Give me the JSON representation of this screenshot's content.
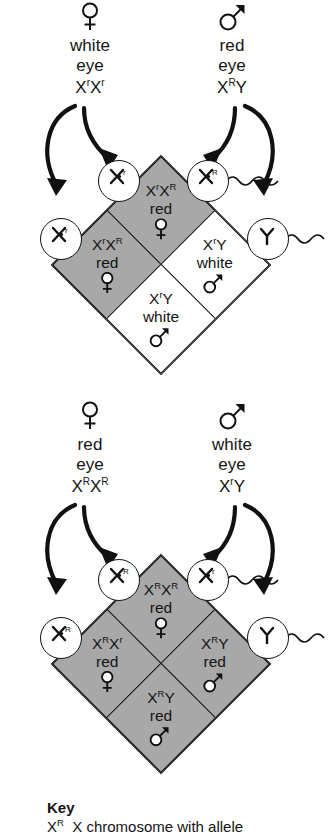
{
  "figure": {
    "type": "punnett-square-diagram",
    "topic": "X-linked eye color inheritance in fruit flies",
    "shaded_meaning": "red eye (dominant phenotype)"
  },
  "crosses": [
    {
      "id": "cross-1",
      "female_parent": {
        "sex": "female",
        "sex_symbol": "venus-symbol",
        "phenotype_line1": "white",
        "phenotype_line2": "eye",
        "genotype": "XʳXʳ",
        "genotype_base": "X",
        "allele_sup": "r"
      },
      "male_parent": {
        "sex": "male",
        "sex_symbol": "mars-symbol",
        "phenotype_line1": "red",
        "phenotype_line2": "eye",
        "genotype": "XᴿY",
        "genotype_base": "X",
        "allele_sup": "R"
      },
      "gametes": {
        "eggs": [
          {
            "label": "X",
            "sup": "r",
            "name": "egg-top-left"
          },
          {
            "label": "X",
            "sup": "r",
            "name": "egg-left"
          }
        ],
        "sperm": [
          {
            "label": "X",
            "sup": "R",
            "name": "sperm-top-right",
            "has_tail": true
          },
          {
            "label": "Y",
            "sup": "",
            "name": "sperm-right",
            "has_tail": true
          }
        ]
      },
      "cells": [
        {
          "position": "top",
          "genotype_base": "X",
          "sup1": "r",
          "mid": "X",
          "sup2": "R",
          "phenotype": "red",
          "sex": "female",
          "shaded": true
        },
        {
          "position": "right",
          "genotype_base": "X",
          "sup1": "r",
          "mid": "Y",
          "sup2": "",
          "phenotype": "white",
          "sex": "male",
          "shaded": false
        },
        {
          "position": "left",
          "genotype_base": "X",
          "sup1": "r",
          "mid": "X",
          "sup2": "R",
          "phenotype": "red",
          "sex": "female",
          "shaded": true
        },
        {
          "position": "bottom",
          "genotype_base": "X",
          "sup1": "r",
          "mid": "Y",
          "sup2": "",
          "phenotype": "white",
          "sex": "male",
          "shaded": false
        }
      ]
    },
    {
      "id": "cross-2",
      "female_parent": {
        "sex": "female",
        "sex_symbol": "venus-symbol",
        "phenotype_line1": "red",
        "phenotype_line2": "eye",
        "genotype": "XᴿXᴿ",
        "genotype_base": "X",
        "allele_sup": "R"
      },
      "male_parent": {
        "sex": "male",
        "sex_symbol": "mars-symbol",
        "phenotype_line1": "white",
        "phenotype_line2": "eye",
        "genotype": "XʳY",
        "genotype_base": "X",
        "allele_sup": "r"
      },
      "gametes": {
        "eggs": [
          {
            "label": "X",
            "sup": "R",
            "name": "egg-top-left"
          },
          {
            "label": "X",
            "sup": "R",
            "name": "egg-left"
          }
        ],
        "sperm": [
          {
            "label": "X",
            "sup": "r",
            "name": "sperm-top-right",
            "has_tail": true
          },
          {
            "label": "Y",
            "sup": "",
            "name": "sperm-right",
            "has_tail": true
          }
        ]
      },
      "cells": [
        {
          "position": "top",
          "genotype_base": "X",
          "sup1": "R",
          "mid": "X",
          "sup2": "R",
          "phenotype": "red",
          "sex": "female",
          "shaded": true
        },
        {
          "position": "right",
          "genotype_base": "X",
          "sup1": "R",
          "mid": "Y",
          "sup2": "",
          "phenotype": "red",
          "sex": "male",
          "shaded": true
        },
        {
          "position": "left",
          "genotype_base": "X",
          "sup1": "R",
          "mid": "X",
          "sup2": "r",
          "phenotype": "red",
          "sex": "female",
          "shaded": true
        },
        {
          "position": "bottom",
          "genotype_base": "X",
          "sup1": "R",
          "mid": "Y",
          "sup2": "",
          "phenotype": "red",
          "sex": "male",
          "shaded": true
        }
      ]
    }
  ],
  "key": {
    "title": "Key",
    "entries": [
      {
        "symbol_base": "X",
        "symbol_sup": "R",
        "description": "X chromosome with allele"
      }
    ]
  }
}
